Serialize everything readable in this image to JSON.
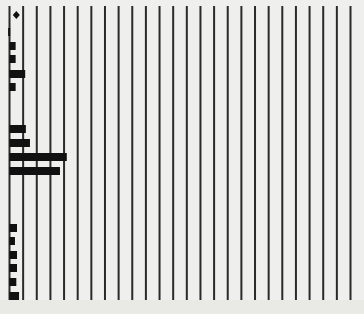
{
  "colors": {
    "background": "#efefed",
    "grid_line": "#2a2a2a",
    "bar": "#111111",
    "marker": "#111111"
  },
  "chart_data": {
    "type": "bar",
    "orientation": "horizontal",
    "title": "",
    "xlabel": "",
    "ylabel": "",
    "grid": true,
    "grid_lines_vertical": 26,
    "legend": "none",
    "xlim": [
      0,
      25
    ],
    "unit_per_grid": 1,
    "marker": {
      "shape": "diamond",
      "row": 0,
      "x": 0.5
    },
    "bars": [
      {
        "row_y": 32,
        "start": -0.1,
        "value": 0.15
      },
      {
        "row_y": 46,
        "start": 0,
        "value": 0.45
      },
      {
        "row_y": 59,
        "start": 0,
        "value": 0.45
      },
      {
        "row_y": 74,
        "start": 0,
        "value": 1.15
      },
      {
        "row_y": 87,
        "start": 0,
        "value": 0.45
      },
      {
        "row_y": 129,
        "start": 0,
        "value": 1.2
      },
      {
        "row_y": 143,
        "start": 0,
        "value": 1.5
      },
      {
        "row_y": 157,
        "start": 0,
        "value": 4.2
      },
      {
        "row_y": 171,
        "start": 0,
        "value": 3.7
      },
      {
        "row_y": 228,
        "start": 0,
        "value": 0.55
      },
      {
        "row_y": 241,
        "start": 0,
        "value": 0.4
      },
      {
        "row_y": 255,
        "start": 0,
        "value": 0.55
      },
      {
        "row_y": 268,
        "start": 0,
        "value": 0.55
      },
      {
        "row_y": 282,
        "start": 0,
        "value": 0.5
      },
      {
        "row_y": 296,
        "start": 0,
        "value": 0.7
      }
    ],
    "values": [
      0.15,
      0.45,
      0.45,
      1.15,
      0.45,
      1.2,
      1.5,
      4.2,
      3.7,
      0.55,
      0.4,
      0.55,
      0.55,
      0.5,
      0.7
    ]
  }
}
